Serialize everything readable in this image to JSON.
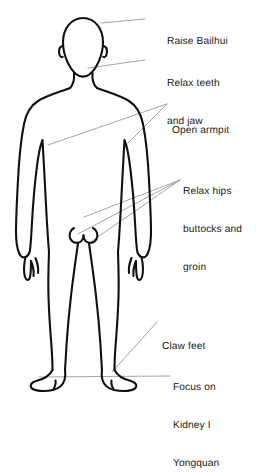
{
  "diagram": {
    "figure_name": "human-body-outline-front-view",
    "colors": {
      "background": "#ffffff",
      "outline": "#111111",
      "leader_line": "#9a9a9a",
      "text": "#1b1b1b"
    },
    "labels": [
      {
        "id": "raise-bailhui",
        "name": "label-raise-bailhui",
        "lines": [
          "Raise Bailhui"
        ],
        "x": 167,
        "y": 11,
        "leaders": [
          {
            "x1": 145,
            "y1": 19,
            "x2": 101,
            "y2": 23
          }
        ]
      },
      {
        "id": "relax-teeth-and-jaw",
        "name": "label-relax-teeth-and-jaw",
        "lines": [
          "Relax teeth",
          "and jaw"
        ],
        "x": 167,
        "y": 53,
        "leaders": [
          {
            "x1": 145,
            "y1": 60,
            "x2": 88,
            "y2": 68
          }
        ]
      },
      {
        "id": "open-armpit",
        "name": "label-open-armpit",
        "lines": [
          "Open armpit"
        ],
        "x": 172,
        "y": 100,
        "leaders": [
          {
            "x1": 167,
            "y1": 104,
            "x2": 48,
            "y2": 145
          },
          {
            "x1": 167,
            "y1": 104,
            "x2": 128,
            "y2": 143
          }
        ]
      },
      {
        "id": "relax-hips-buttocks-and-groin",
        "name": "label-relax-hips-buttocks-and-groin",
        "lines": [
          "Relax hips",
          "buttocks and",
          "groin"
        ],
        "x": 183,
        "y": 161,
        "leaders": [
          {
            "x1": 180,
            "y1": 180,
            "x2": 84,
            "y2": 217
          },
          {
            "x1": 180,
            "y1": 180,
            "x2": 78,
            "y2": 234
          },
          {
            "x1": 180,
            "y1": 180,
            "x2": 92,
            "y2": 241
          }
        ]
      },
      {
        "id": "claw-feet",
        "name": "label-claw-feet",
        "lines": [
          "Claw feet"
        ],
        "x": 162,
        "y": 316,
        "leaders": [
          {
            "x1": 157,
            "y1": 322,
            "x2": 112,
            "y2": 372
          }
        ]
      },
      {
        "id": "focus-on-kidney-1-yongquan",
        "name": "label-focus-on-kidney-yongquan",
        "lines": [
          "Focus on",
          "Kidney I",
          "Yongquan"
        ],
        "x": 173,
        "y": 357,
        "leaders": [
          {
            "x1": 170,
            "y1": 376,
            "x2": 39,
            "y2": 377
          }
        ]
      }
    ]
  }
}
